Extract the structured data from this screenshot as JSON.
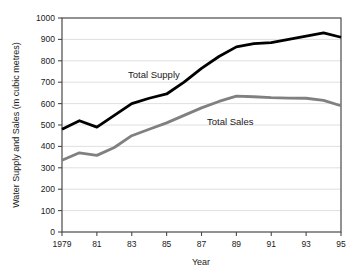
{
  "chart_data": {
    "type": "line",
    "title": "",
    "xlabel": "Year",
    "ylabel": "Water Supply and Sales (m cubic metres)",
    "xlim": [
      1979,
      1995
    ],
    "ylim": [
      0,
      1000
    ],
    "grid": true,
    "legend_position": "inline-labels",
    "x": [
      1979,
      1980,
      1981,
      1982,
      1983,
      1984,
      1985,
      1986,
      1987,
      1988,
      1989,
      1990,
      1991,
      1992,
      1993,
      1994,
      1995
    ],
    "x_tick_labels": [
      "1979",
      "81",
      "83",
      "85",
      "87",
      "89",
      "91",
      "93",
      "95"
    ],
    "x_tick_values": [
      1979,
      1981,
      1983,
      1985,
      1987,
      1989,
      1991,
      1993,
      1995
    ],
    "y_tick_labels": [
      "0",
      "100",
      "200",
      "300",
      "400",
      "500",
      "600",
      "700",
      "800",
      "900",
      "1000"
    ],
    "y_tick_values": [
      0,
      100,
      200,
      300,
      400,
      500,
      600,
      700,
      800,
      900,
      1000
    ],
    "series": [
      {
        "name": "Total Supply",
        "color": "#000000",
        "label_text": "Total Supply",
        "values": [
          480,
          520,
          490,
          545,
          600,
          625,
          645,
          700,
          765,
          820,
          865,
          880,
          885,
          900,
          915,
          930,
          910
        ]
      },
      {
        "name": "Total Sales",
        "color": "#808080",
        "label_text": "Total Sales",
        "values": [
          335,
          370,
          358,
          395,
          450,
          480,
          510,
          545,
          580,
          610,
          635,
          632,
          628,
          626,
          625,
          615,
          590
        ]
      }
    ]
  },
  "labels": {
    "y_axis_title": "Water Supply and Sales (m cubic metres)",
    "x_axis_title": "Year",
    "series_supply": "Total Supply",
    "series_sales": "Total Sales"
  }
}
